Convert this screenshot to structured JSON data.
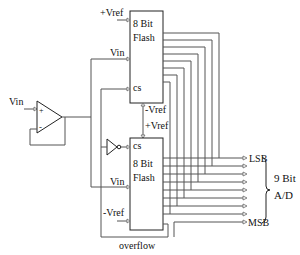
{
  "diagram": {
    "top_flash": {
      "line1": "8 Bit",
      "line2": "Flash",
      "pin_vref_pos": "+Vref",
      "pin_vin": "Vin",
      "pin_cs": "cs",
      "pin_vref_neg": "-Vref"
    },
    "bottom_flash": {
      "line1": "8 Bit",
      "line2": "Flash",
      "pin_vref_pos": "+Vref",
      "pin_vin": "Vin",
      "pin_cs": "cs",
      "pin_vref_neg": "-Vref",
      "overflow": "overflow"
    },
    "buffer": {
      "input_label": "Vin",
      "plus": "+",
      "minus": "-"
    },
    "outputs": {
      "lsb": "LSB",
      "msb": "MSB",
      "count": 9
    },
    "bracket_label_line1": "9 Bit",
    "bracket_label_line2": "A/D"
  }
}
